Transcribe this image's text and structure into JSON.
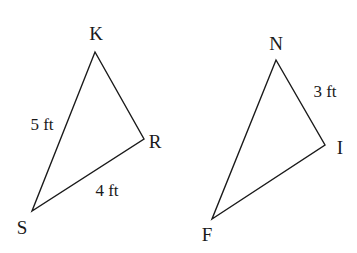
{
  "diagram": {
    "triangle_left": {
      "vertices": {
        "K": {
          "label": "K",
          "x": 95,
          "y": 52,
          "lx": 96,
          "ly": 40
        },
        "R": {
          "label": "R",
          "x": 144,
          "y": 139,
          "lx": 155,
          "ly": 148
        },
        "S": {
          "label": "S",
          "x": 32,
          "y": 211,
          "lx": 22,
          "ly": 234
        }
      },
      "side_labels": {
        "KS": {
          "text": "5 ft",
          "x": 42,
          "y": 130
        },
        "SR": {
          "text": "4 ft",
          "x": 107,
          "y": 196
        }
      }
    },
    "triangle_right": {
      "vertices": {
        "N": {
          "label": "N",
          "x": 276,
          "y": 60,
          "lx": 276,
          "ly": 50
        },
        "I": {
          "label": "I",
          "x": 325,
          "y": 145,
          "lx": 340,
          "ly": 154
        },
        "F": {
          "label": "F",
          "x": 212,
          "y": 219,
          "lx": 207,
          "ly": 241
        }
      },
      "side_labels": {
        "NI": {
          "text": "3 ft",
          "x": 325,
          "y": 97
        }
      }
    }
  }
}
